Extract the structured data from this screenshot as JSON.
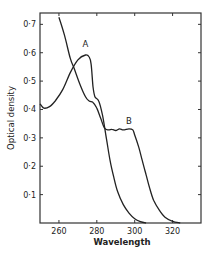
{
  "chart_data": {
    "type": "line",
    "title": "",
    "xlabel": "Wavelength",
    "ylabel": "Optical density",
    "xlim": [
      250,
      335
    ],
    "ylim": [
      0,
      0.74
    ],
    "grid": false,
    "legend": "inline curve labels",
    "x_ticks": [
      260,
      280,
      300,
      320
    ],
    "x_tick_labels": [
      "260",
      "280",
      "300",
      "320"
    ],
    "y_ticks": [
      0.1,
      0.2,
      0.3,
      0.4,
      0.5,
      0.6,
      0.7
    ],
    "y_tick_labels": [
      "0·1",
      "0·2",
      "0·3",
      "0·4",
      "0·5",
      "0·6",
      "0·7"
    ],
    "series": [
      {
        "name": "A",
        "label_pos": [
          274,
          0.62
        ],
        "points": [
          [
            250,
            0.42
          ],
          [
            252,
            0.405
          ],
          [
            255,
            0.41
          ],
          [
            258,
            0.43
          ],
          [
            262,
            0.47
          ],
          [
            266,
            0.53
          ],
          [
            270,
            0.575
          ],
          [
            274,
            0.592
          ],
          [
            276,
            0.585
          ],
          [
            277,
            0.56
          ],
          [
            278,
            0.48
          ],
          [
            279,
            0.445
          ],
          [
            281,
            0.43
          ],
          [
            283,
            0.38
          ],
          [
            285,
            0.3
          ],
          [
            287,
            0.22
          ],
          [
            289,
            0.16
          ],
          [
            291,
            0.11
          ],
          [
            294,
            0.065
          ],
          [
            297,
            0.035
          ],
          [
            300,
            0.015
          ],
          [
            303,
            0.005
          ],
          [
            306,
            0.0
          ]
        ]
      },
      {
        "name": "B",
        "label_pos": [
          297,
          0.35
        ],
        "points": [
          [
            260,
            0.725
          ],
          [
            263,
            0.66
          ],
          [
            266,
            0.58
          ],
          [
            268,
            0.545
          ],
          [
            271,
            0.49
          ],
          [
            274,
            0.445
          ],
          [
            276,
            0.43
          ],
          [
            278,
            0.425
          ],
          [
            280,
            0.405
          ],
          [
            282,
            0.37
          ],
          [
            284,
            0.335
          ],
          [
            286,
            0.328
          ],
          [
            288,
            0.33
          ],
          [
            290,
            0.326
          ],
          [
            292,
            0.332
          ],
          [
            294,
            0.328
          ],
          [
            297,
            0.332
          ],
          [
            299,
            0.328
          ],
          [
            300,
            0.31
          ],
          [
            302,
            0.27
          ],
          [
            304,
            0.22
          ],
          [
            306,
            0.17
          ],
          [
            308,
            0.12
          ],
          [
            310,
            0.08
          ],
          [
            313,
            0.045
          ],
          [
            316,
            0.02
          ],
          [
            320,
            0.006
          ],
          [
            324,
            0.0
          ]
        ]
      }
    ]
  }
}
